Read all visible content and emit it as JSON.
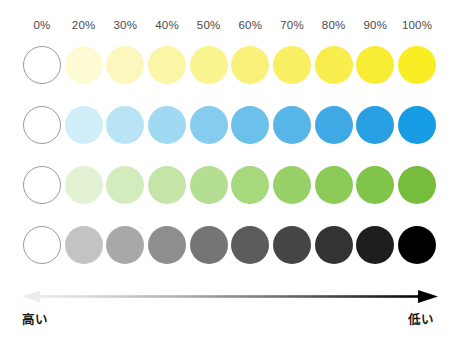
{
  "figure": {
    "title_visible": false,
    "background": "#ffffff"
  },
  "columns": {
    "header_labels": [
      "0%",
      "20%",
      "30%",
      "40%",
      "50%",
      "60%",
      "70%",
      "80%",
      "90%",
      "100%"
    ],
    "values": [
      0,
      20,
      30,
      40,
      50,
      60,
      70,
      80,
      90,
      100
    ]
  },
  "axis": {
    "left_label": "高い",
    "right_label": "低い",
    "arrow_gradient_from": "#e8e8e8",
    "arrow_gradient_to": "#000000",
    "double_headed": true
  },
  "chart_data": {
    "type": "heatmap",
    "title": "",
    "subtitle": "",
    "xlabel": "",
    "ylabel": "",
    "grid": false,
    "legend_position": "none",
    "x": [
      0,
      20,
      30,
      40,
      50,
      60,
      70,
      80,
      90,
      100
    ],
    "categories": [
      "0%",
      "20%",
      "30%",
      "40%",
      "50%",
      "60%",
      "70%",
      "80%",
      "90%",
      "100%"
    ],
    "annotations": [
      "高い",
      "低い"
    ],
    "series": [
      {
        "name": "yellow",
        "row_index": 0,
        "values": [
          0,
          20,
          30,
          40,
          50,
          60,
          70,
          80,
          90,
          100
        ],
        "colors": [
          "#ffffff",
          "#fdfbd4",
          "#fcf8bd",
          "#fbf6a6",
          "#faf490",
          "#f9f179",
          "#f9ef62",
          "#f8ed4c",
          "#f8ec35",
          "#f9ee23"
        ]
      },
      {
        "name": "blue",
        "row_index": 1,
        "values": [
          0,
          20,
          30,
          40,
          50,
          60,
          70,
          80,
          90,
          100
        ],
        "colors": [
          "#ffffff",
          "#d0eef8",
          "#b8e4f5",
          "#a0d9f2",
          "#84cdee",
          "#6cc1eb",
          "#57b5e8",
          "#3fa9e5",
          "#29a0e3",
          "#159ce2"
        ]
      },
      {
        "name": "green",
        "row_index": 2,
        "values": [
          0,
          20,
          30,
          40,
          50,
          60,
          70,
          80,
          90,
          100
        ],
        "colors": [
          "#ffffff",
          "#e2f2d2",
          "#d3ecbd",
          "#c4e5a7",
          "#b4de91",
          "#a6d87c",
          "#99d169",
          "#8bca56",
          "#80c44a",
          "#76bd3e"
        ]
      },
      {
        "name": "grayscale",
        "row_index": 3,
        "values": [
          0,
          20,
          30,
          40,
          50,
          60,
          70,
          80,
          90,
          100
        ],
        "colors": [
          "#ffffff",
          "#c3c3c3",
          "#a8a8a8",
          "#8e8e8e",
          "#757575",
          "#5c5c5c",
          "#454545",
          "#333333",
          "#1e1e1e",
          "#000000"
        ]
      }
    ]
  }
}
